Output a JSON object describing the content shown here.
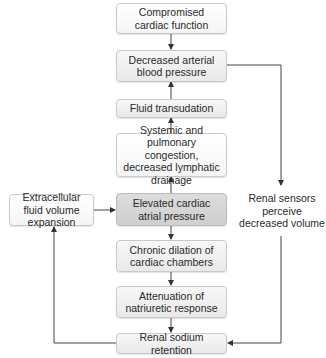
{
  "diagram": {
    "nodes": [
      {
        "id": "compromised",
        "text": "Compromised cardiac function"
      },
      {
        "id": "decreased_bp",
        "text": "Decreased arterial blood pressure"
      },
      {
        "id": "fluid_transudation",
        "text": "Fluid transudation"
      },
      {
        "id": "congestion",
        "text": "Systemic and pulmonary congestion, decreased lymphatic drainage"
      },
      {
        "id": "elevated_pressure",
        "text": "Elevated cardiac atrial pressure"
      },
      {
        "id": "chronic_dilation",
        "text": "Chronic dilation of cardiac chambers"
      },
      {
        "id": "attenuation",
        "text": "Attenuation of natriuretic response"
      },
      {
        "id": "renal_retention",
        "text": "Renal sodium retention"
      },
      {
        "id": "ecf_expansion",
        "text": "Extracellular fluid volume expansion"
      }
    ],
    "side_label": "Renal sensors perceive decreased volume",
    "edges": [
      {
        "from": "compromised",
        "to": "decreased_bp"
      },
      {
        "from": "decreased_bp",
        "to": "renal_retention",
        "via": "Renal sensors perceive decreased volume"
      },
      {
        "from": "fluid_transudation",
        "to": "decreased_bp"
      },
      {
        "from": "congestion",
        "to": "fluid_transudation"
      },
      {
        "from": "elevated_pressure",
        "to": "congestion"
      },
      {
        "from": "elevated_pressure",
        "to": "chronic_dilation"
      },
      {
        "from": "chronic_dilation",
        "to": "attenuation"
      },
      {
        "from": "attenuation",
        "to": "renal_retention"
      },
      {
        "from": "renal_retention",
        "to": "ecf_expansion"
      },
      {
        "from": "ecf_expansion",
        "to": "elevated_pressure"
      }
    ]
  }
}
